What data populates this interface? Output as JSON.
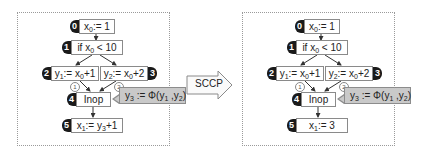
{
  "transform": {
    "label": "SCCP"
  },
  "before": {
    "nodes": [
      {
        "id": "0",
        "var": "x",
        "sub": "0",
        "rest": ":= 1"
      },
      {
        "id": "1",
        "pre": "if x",
        "sub": "0",
        "rest": " < 10"
      },
      {
        "id": "2",
        "var": "y",
        "sub": "1",
        "mid": ":= x",
        "sub2": "0",
        "rest": "+1"
      },
      {
        "id": "3",
        "var": "y",
        "sub": "2",
        "mid": ":= x",
        "sub2": "0",
        "rest": "+2"
      },
      {
        "id": "4",
        "text": "Inop"
      },
      {
        "id": "5",
        "var": "x",
        "sub": "1",
        "mid": ":= y",
        "sub2": "3",
        "rest": "+1"
      }
    ],
    "phi": {
      "lhs": "y",
      "lhs_sub": "3",
      "op": " := Φ(y",
      "a_sub": "1",
      "sep": " ,y",
      "b_sub": "2",
      "close": ")"
    },
    "edge_labels": [
      "1",
      "2"
    ]
  },
  "after": {
    "nodes": [
      {
        "id": "0",
        "var": "x",
        "sub": "0",
        "rest": ":= 1"
      },
      {
        "id": "1",
        "pre": "if x",
        "sub": "0",
        "rest": " < 10"
      },
      {
        "id": "2",
        "var": "y",
        "sub": "1",
        "mid": ":= x",
        "sub2": "0",
        "rest": "+1"
      },
      {
        "id": "3",
        "var": "y",
        "sub": "2",
        "mid": ":= x",
        "sub2": "0",
        "rest": "+2"
      },
      {
        "id": "4",
        "text": "Inop"
      },
      {
        "id": "5",
        "var": "x",
        "sub": "1",
        "rest": ":= 3"
      }
    ],
    "phi": {
      "lhs": "y",
      "lhs_sub": "3",
      "op": " := Φ(y",
      "a_sub": "1",
      "sep": " ,y",
      "b_sub": "2",
      "close": ")"
    },
    "edge_labels": [
      "1",
      "2"
    ]
  }
}
